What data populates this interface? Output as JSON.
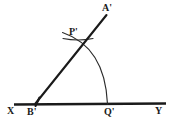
{
  "figure": {
    "background_color": "#ffffff",
    "stroke_color": "#1a1a1a",
    "width": 172,
    "height": 127,
    "labels": {
      "x": "X",
      "b_prime": "B'",
      "q_prime": "Q'",
      "y": "Y",
      "p_prime": "P'",
      "a_prime": "A'"
    },
    "points": {
      "X": {
        "x": 14,
        "y": 104
      },
      "B'": {
        "x": 35,
        "y": 104
      },
      "Q'": {
        "x": 107,
        "y": 104
      },
      "Y": {
        "x": 166,
        "y": 103
      },
      "P'": {
        "x": 79,
        "y": 46
      },
      "A'": {
        "x": 107,
        "y": 14
      }
    },
    "elements": {
      "base_ray_label": "Ray XY",
      "angle_ray_label": "Ray B'A'",
      "main_arc_label": "Arc P'Q' centered at B'",
      "cross_arc_label": "Intersecting compass arc at P'",
      "vertex_tick_label": "Vertex tick at B'"
    },
    "geometry": {
      "arc_radius": 72,
      "arc_center": "B'",
      "ray_angle_degrees": 51
    }
  }
}
